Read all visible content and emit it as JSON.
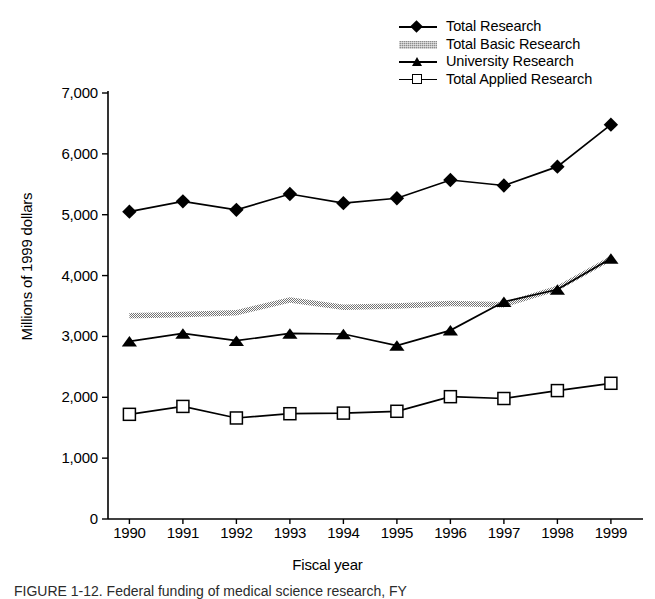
{
  "chart_data": {
    "type": "line",
    "title": "",
    "xlabel": "Fiscal year",
    "ylabel": "Millions of 1999 dollars",
    "categories": [
      "1990",
      "1991",
      "1992",
      "1993",
      "1994",
      "1995",
      "1996",
      "1997",
      "1998",
      "1999"
    ],
    "x": [
      1990,
      1991,
      1992,
      1993,
      1994,
      1995,
      1996,
      1997,
      1998,
      1999
    ],
    "xlim": [
      1989.6,
      1999.6
    ],
    "ylim": [
      0,
      7000
    ],
    "yticks": [
      0,
      1000,
      2000,
      3000,
      4000,
      5000,
      6000,
      7000
    ],
    "ytick_labels": [
      "0",
      "1,000",
      "2,000",
      "3,000",
      "4,000",
      "5,000",
      "6,000",
      "7,000"
    ],
    "grid": false,
    "legend_position": "top-right",
    "series": [
      {
        "name": "Total Research",
        "marker": "filled-diamond",
        "color": "#000000",
        "values": [
          5050,
          5220,
          5080,
          5340,
          5190,
          5270,
          5570,
          5480,
          5790,
          6480
        ]
      },
      {
        "name": "Total Basic Research",
        "marker": "shaded-band",
        "color": "#8d8d8d",
        "values": [
          3340,
          3360,
          3390,
          3600,
          3480,
          3500,
          3540,
          3520,
          3790,
          4280
        ]
      },
      {
        "name": "University Research",
        "marker": "filled-triangle",
        "color": "#000000",
        "values": [
          2920,
          3050,
          2930,
          3050,
          3040,
          2850,
          3100,
          3570,
          3770,
          4280
        ]
      },
      {
        "name": "Total Applied Research",
        "marker": "open-square",
        "color": "#000000",
        "values": [
          1720,
          1850,
          1660,
          1730,
          1740,
          1770,
          2010,
          1980,
          2110,
          2230
        ]
      }
    ]
  },
  "legend": {
    "items": [
      {
        "label": "Total Research",
        "key": "line-diamond-key"
      },
      {
        "label": "Total Basic Research",
        "key": "band-key"
      },
      {
        "label": "University Research",
        "key": "line-triangle-key"
      },
      {
        "label": "Total Applied Research",
        "key": "line-square-key"
      }
    ]
  },
  "caption": "FIGURE 1-12. Federal funding of medical science research, FY"
}
